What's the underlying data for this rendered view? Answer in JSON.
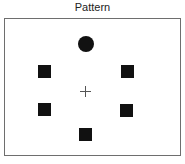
{
  "title": "Pattern",
  "colors": {
    "frame": "#6e6e6e",
    "marker": "#111111",
    "fixation": "#555555",
    "background": "#ffffff"
  },
  "fixation": {
    "shape": "cross",
    "cx": 85,
    "cy": 91,
    "size": 11
  },
  "markers": [
    {
      "id": "top",
      "shape": "circle",
      "x": 78,
      "y": 36,
      "size": 16
    },
    {
      "id": "upper-left",
      "shape": "square",
      "x": 38,
      "y": 65,
      "size": 13
    },
    {
      "id": "upper-right",
      "shape": "square",
      "x": 121,
      "y": 65,
      "size": 13
    },
    {
      "id": "lower-left",
      "shape": "square",
      "x": 38,
      "y": 103,
      "size": 13
    },
    {
      "id": "lower-right",
      "shape": "square",
      "x": 120,
      "y": 104,
      "size": 13
    },
    {
      "id": "bottom",
      "shape": "square",
      "x": 79,
      "y": 128,
      "size": 13
    }
  ]
}
